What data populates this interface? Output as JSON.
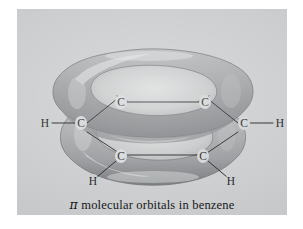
{
  "figure": {
    "caption_symbol": "π",
    "caption_text": " molecular orbitals in benzene",
    "caption_full": "π molecular orbitals in benzene",
    "panel_color": "#c9cacb",
    "background_color": "#ffffff",
    "lobe_color": "#9a9c9e",
    "lobe_highlight": "#dcdddd",
    "lobe_shadow": "#6e7173",
    "bond_color": "#14171a",
    "label_color": "#0c0e10"
  },
  "molecule": {
    "name": "benzene",
    "orbital_type": "pi molecular orbital",
    "lobe_count": 2,
    "lobes": [
      {
        "name": "upper-pi-lobe",
        "position": "above ring plane"
      },
      {
        "name": "lower-pi-lobe",
        "position": "below ring plane"
      }
    ],
    "atoms": [
      {
        "id": "c-back-left",
        "element": "C",
        "label": "C"
      },
      {
        "id": "c-back-right",
        "element": "C",
        "label": "C"
      },
      {
        "id": "c-mid-left",
        "element": "C",
        "label": "C"
      },
      {
        "id": "c-mid-right",
        "element": "C",
        "label": "C"
      },
      {
        "id": "c-front-left",
        "element": "C",
        "label": "C"
      },
      {
        "id": "c-front-right",
        "element": "C",
        "label": "C"
      },
      {
        "id": "h-left",
        "element": "H",
        "label": "H"
      },
      {
        "id": "h-right",
        "element": "H",
        "label": "H"
      },
      {
        "id": "h-front-left",
        "element": "H",
        "label": "H"
      },
      {
        "id": "h-front-right",
        "element": "H",
        "label": "H"
      }
    ]
  }
}
